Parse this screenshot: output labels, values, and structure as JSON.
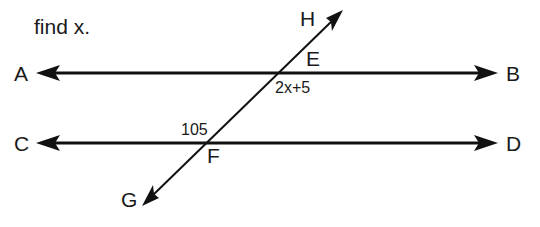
{
  "prompt": "find x.",
  "points": {
    "A": "A",
    "B": "B",
    "C": "C",
    "D": "D",
    "E": "E",
    "F": "F",
    "G": "G",
    "H": "H"
  },
  "angles": {
    "at_E": "2x+5",
    "at_F": "105"
  },
  "lines": [
    {
      "name": "AB",
      "type": "line",
      "arrows": "both"
    },
    {
      "name": "CD",
      "type": "line",
      "arrows": "both"
    },
    {
      "name": "GH",
      "type": "transversal",
      "arrows": "both"
    }
  ],
  "colors": {
    "ink": "#111111",
    "background": "#ffffff"
  }
}
